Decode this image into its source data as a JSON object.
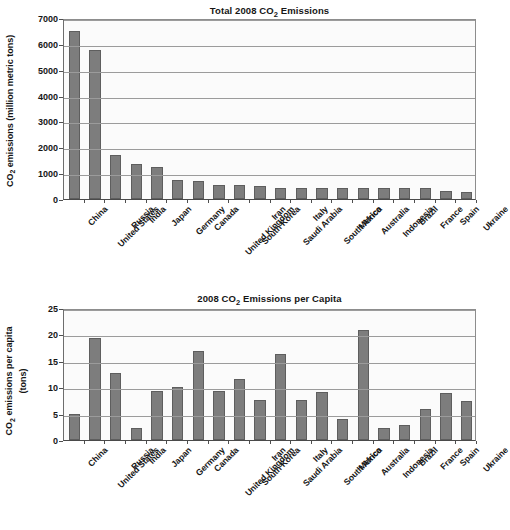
{
  "chart_data": [
    {
      "type": "bar",
      "id": "total-emissions",
      "title": "Total 2008 CO₂ Emissions",
      "title_parts": {
        "pre": "Total 2008 CO",
        "sub": "2",
        "post": " Emissions"
      },
      "xlabel": "",
      "ylabel": "CO₂ emissions (million metric tons)",
      "ylabel_parts": {
        "pre": "CO",
        "sub": "2",
        "post": " emissions (million metric tons)"
      },
      "ylim": [
        0,
        7000
      ],
      "yticks": [
        0,
        1000,
        2000,
        3000,
        4000,
        5000,
        6000,
        7000
      ],
      "ytick_labels": [
        "0",
        "1000",
        "2000",
        "3000",
        "4000",
        "5000",
        "6000",
        "7000"
      ],
      "grid": true,
      "legend": "none",
      "bar_color": "#7d7d7d",
      "bar_edge_color": "#5e5e5e",
      "categories": [
        "China",
        "United States",
        "Russia",
        "India",
        "Japan",
        "Germany",
        "Canada",
        "United Kingdom",
        "South Korea",
        "Iran",
        "Saudi Arabia",
        "Italy",
        "South Africa",
        "Mexico",
        "Australia",
        "Indonesia",
        "Brazil",
        "France",
        "Spain",
        "Ukraine"
      ],
      "values": [
        6480,
        5750,
        1700,
        1350,
        1220,
        750,
        710,
        545,
        540,
        490,
        440,
        435,
        435,
        435,
        430,
        425,
        420,
        420,
        320,
        265
      ]
    },
    {
      "type": "bar",
      "id": "per-capita-emissions",
      "title": "2008 CO₂ Emissions per Capita",
      "title_parts": {
        "pre": "2008 CO",
        "sub": "2",
        "post": " Emissions per Capita"
      },
      "xlabel": "",
      "ylabel": "CO₂ emissions per capita (tons)",
      "ylabel_parts": {
        "pre": "CO",
        "sub": "2",
        "post": " emissions per capita",
        "line2": "(tons)"
      },
      "ylim": [
        0,
        25
      ],
      "yticks": [
        0,
        5,
        10,
        15,
        20,
        25
      ],
      "ytick_labels": [
        "0",
        "5",
        "10",
        "15",
        "20",
        "25"
      ],
      "grid": true,
      "legend": "none",
      "bar_color": "#7d7d7d",
      "bar_edge_color": "#5e5e5e",
      "categories": [
        "China",
        "United States",
        "Russia",
        "India",
        "Japan",
        "Germany",
        "Canada",
        "United Kingdom",
        "South Korea",
        "Iran",
        "Saudi Arabia",
        "Italy",
        "South Africa",
        "Mexico",
        "Australia",
        "Indonesia",
        "Brazil",
        "France",
        "Spain",
        "Ukraine"
      ],
      "values": [
        4.9,
        19.4,
        12.7,
        2.2,
        9.3,
        10.0,
        16.8,
        9.2,
        11.5,
        7.5,
        16.2,
        7.5,
        9.0,
        4.0,
        20.9,
        2.2,
        2.8,
        5.9,
        8.9,
        7.4
      ]
    }
  ]
}
